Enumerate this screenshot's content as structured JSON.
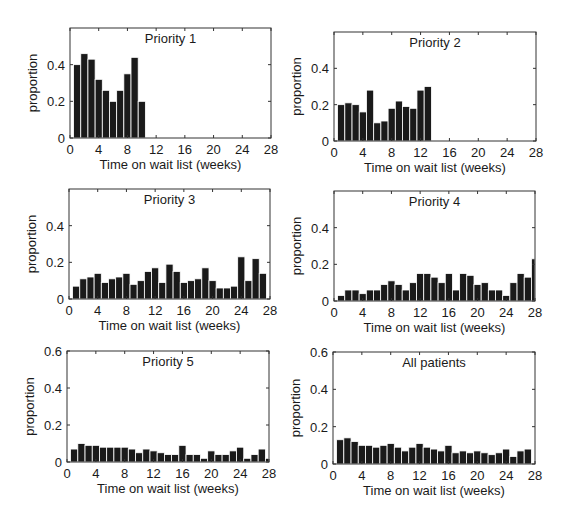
{
  "figure": {
    "bar_color": "#1a1a1a",
    "bar_edge_color": "#ffffff",
    "axis_color": "#333333"
  },
  "chart_data": [
    {
      "type": "bar",
      "title": "Priority 1",
      "xlabel": "Time on wait list (weeks)",
      "ylabel": "proportion",
      "xlim": [
        0,
        28
      ],
      "ylim": [
        0,
        0.6
      ],
      "xticks": [
        0,
        4,
        8,
        12,
        16,
        20,
        24,
        28
      ],
      "yticks": [
        0,
        0.2,
        0.4
      ],
      "ytick_labels": [
        "0",
        "0.2",
        "0.4"
      ],
      "x": [
        1,
        2,
        3,
        4,
        5,
        6,
        7,
        8,
        9,
        10
      ],
      "values": [
        0.4,
        0.46,
        0.43,
        0.32,
        0.26,
        0.2,
        0.26,
        0.35,
        0.44,
        0.2
      ],
      "frame": {
        "left": 70,
        "top": 28,
        "right": 271,
        "bottom": 138
      }
    },
    {
      "type": "bar",
      "title": "Priority 2",
      "xlabel": "Time on wait list (weeks)",
      "ylabel": "proportion",
      "xlim": [
        0,
        28
      ],
      "ylim": [
        0,
        0.6
      ],
      "xticks": [
        0,
        4,
        8,
        12,
        16,
        20,
        24,
        28
      ],
      "yticks": [
        0,
        0.2,
        0.4
      ],
      "ytick_labels": [
        "0",
        "0.2",
        "0.4"
      ],
      "x": [
        1,
        2,
        3,
        4,
        5,
        6,
        7,
        8,
        9,
        10,
        11,
        12,
        13
      ],
      "values": [
        0.2,
        0.21,
        0.2,
        0.16,
        0.28,
        0.1,
        0.11,
        0.18,
        0.22,
        0.19,
        0.18,
        0.28,
        0.3
      ],
      "frame": {
        "left": 334,
        "top": 32,
        "right": 536,
        "bottom": 141
      }
    },
    {
      "type": "bar",
      "title": "Priority 3",
      "xlabel": "Time on wait list (weeks)",
      "ylabel": "proportion",
      "xlim": [
        0,
        28
      ],
      "ylim": [
        0,
        0.6
      ],
      "xticks": [
        0,
        4,
        8,
        12,
        16,
        20,
        24,
        28
      ],
      "yticks": [
        0,
        0.2,
        0.4
      ],
      "ytick_labels": [
        "0",
        "0.2",
        "0.4"
      ],
      "x": [
        1,
        2,
        3,
        4,
        5,
        6,
        7,
        8,
        9,
        10,
        11,
        12,
        13,
        14,
        15,
        16,
        17,
        18,
        19,
        20,
        21,
        22,
        23,
        24,
        25,
        26,
        27
      ],
      "values": [
        0.07,
        0.11,
        0.12,
        0.14,
        0.09,
        0.11,
        0.12,
        0.14,
        0.08,
        0.1,
        0.15,
        0.17,
        0.09,
        0.19,
        0.15,
        0.09,
        0.1,
        0.11,
        0.17,
        0.1,
        0.06,
        0.06,
        0.07,
        0.23,
        0.1,
        0.22,
        0.14
      ],
      "frame": {
        "left": 69,
        "top": 189,
        "right": 270,
        "bottom": 299
      }
    },
    {
      "type": "bar",
      "title": "Priority 4",
      "xlabel": "Time on wait list (weeks)",
      "ylabel": "proportion",
      "xlim": [
        0,
        28
      ],
      "ylim": [
        0,
        0.6
      ],
      "xticks": [
        0,
        4,
        8,
        12,
        16,
        20,
        24,
        28
      ],
      "yticks": [
        0,
        0.2,
        0.4
      ],
      "ytick_labels": [
        "0",
        "0.2",
        "0.4"
      ],
      "x": [
        1,
        2,
        3,
        4,
        5,
        6,
        7,
        8,
        9,
        10,
        11,
        12,
        13,
        14,
        15,
        16,
        17,
        18,
        19,
        20,
        21,
        22,
        23,
        24,
        25,
        26,
        27,
        28
      ],
      "values": [
        0.03,
        0.06,
        0.06,
        0.04,
        0.06,
        0.06,
        0.09,
        0.11,
        0.09,
        0.06,
        0.1,
        0.15,
        0.15,
        0.13,
        0.1,
        0.15,
        0.06,
        0.15,
        0.14,
        0.09,
        0.1,
        0.06,
        0.06,
        0.03,
        0.1,
        0.15,
        0.13,
        0.23
      ],
      "frame": {
        "left": 334,
        "top": 191,
        "right": 535,
        "bottom": 301
      }
    },
    {
      "type": "bar",
      "title": "Priority 5",
      "xlabel": "Time on wait list (weeks)",
      "ylabel": "proportion",
      "xlim": [
        0,
        28
      ],
      "ylim": [
        0,
        0.6
      ],
      "xticks": [
        0,
        4,
        8,
        12,
        16,
        20,
        24,
        28
      ],
      "yticks": [
        0,
        0.2,
        0.4,
        0.6
      ],
      "ytick_labels": [
        "0",
        "0.2",
        "0.4",
        "0.6"
      ],
      "x": [
        1,
        2,
        3,
        4,
        5,
        6,
        7,
        8,
        9,
        10,
        11,
        12,
        13,
        14,
        15,
        16,
        17,
        18,
        19,
        20,
        21,
        22,
        23,
        24,
        25,
        26,
        27,
        28
      ],
      "values": [
        0.07,
        0.1,
        0.09,
        0.09,
        0.08,
        0.08,
        0.08,
        0.08,
        0.07,
        0.05,
        0.07,
        0.06,
        0.05,
        0.04,
        0.04,
        0.09,
        0.04,
        0.04,
        0.02,
        0.06,
        0.04,
        0.04,
        0.06,
        0.08,
        0.02,
        0.04,
        0.07,
        0.02
      ],
      "frame": {
        "left": 67,
        "top": 351,
        "right": 269,
        "bottom": 462
      }
    },
    {
      "type": "bar",
      "title": "All patients",
      "xlabel": "Time on wait list (weeks)",
      "ylabel": "proportion",
      "xlim": [
        0,
        28
      ],
      "ylim": [
        0,
        0.6
      ],
      "xticks": [
        0,
        4,
        8,
        12,
        16,
        20,
        24,
        28
      ],
      "yticks": [
        0,
        0.2,
        0.4,
        0.6
      ],
      "ytick_labels": [
        "0",
        "0.2",
        "0.4",
        "0.6"
      ],
      "x": [
        1,
        2,
        3,
        4,
        5,
        6,
        7,
        8,
        9,
        10,
        11,
        12,
        13,
        14,
        15,
        16,
        17,
        18,
        19,
        20,
        21,
        22,
        23,
        24,
        25,
        26,
        27
      ],
      "values": [
        0.13,
        0.14,
        0.12,
        0.1,
        0.1,
        0.09,
        0.1,
        0.11,
        0.09,
        0.07,
        0.09,
        0.11,
        0.09,
        0.08,
        0.07,
        0.1,
        0.06,
        0.07,
        0.06,
        0.07,
        0.06,
        0.05,
        0.06,
        0.08,
        0.04,
        0.07,
        0.08
      ],
      "frame": {
        "left": 333,
        "top": 352,
        "right": 535,
        "bottom": 464
      }
    }
  ]
}
